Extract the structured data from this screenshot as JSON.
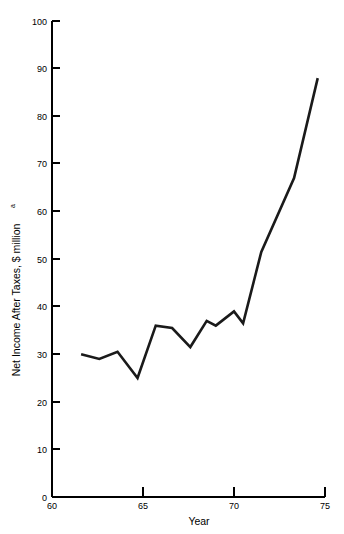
{
  "chart_data": {
    "type": "line",
    "title": "",
    "xlabel": "Year",
    "ylabel": "Net Income After Taxes, $ million",
    "ylabel_superscript": "a",
    "xlim": [
      60,
      75
    ],
    "ylim": [
      0,
      100
    ],
    "grid": false,
    "legend": false,
    "x_ticks": [
      60,
      65,
      70,
      75
    ],
    "x_tick_labels": [
      "60",
      "65",
      "70",
      "75"
    ],
    "y_ticks": [
      0,
      10,
      20,
      30,
      40,
      50,
      60,
      70,
      80,
      90,
      100
    ],
    "y_tick_labels": [
      "0",
      "10",
      "20",
      "30",
      "40",
      "50",
      "60",
      "70",
      "80",
      "90",
      "100"
    ],
    "series": [
      {
        "name": "Net Income After Taxes",
        "color": "#1a1a1a",
        "x": [
          61.6,
          62.6,
          63.6,
          64.7,
          65.7,
          66.6,
          67.6,
          68.5,
          69.0,
          70.0,
          70.5,
          71.5,
          73.3,
          74.6
        ],
        "values": [
          30.0,
          29.0,
          30.5,
          25.0,
          36.0,
          35.5,
          31.5,
          37.0,
          36.0,
          39.0,
          36.5,
          51.5,
          67.0,
          88.0
        ]
      }
    ]
  },
  "axis": {
    "x_axis_name": "year-axis",
    "y_axis_name": "net-income-axis"
  }
}
